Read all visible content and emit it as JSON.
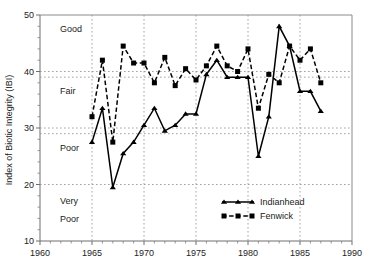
{
  "chart_data": {
    "type": "line",
    "title": "",
    "xlabel": "",
    "ylabel": "Index of Biotic Integrity (IBI)",
    "xlim": [
      1960,
      1990
    ],
    "ylim": [
      10,
      50
    ],
    "xticks": [
      1960,
      1965,
      1970,
      1975,
      1980,
      1985,
      1990
    ],
    "yticks": [
      10,
      20,
      30,
      40,
      50
    ],
    "grid": true,
    "grid_axes": "both",
    "legend_position": "inside lower right",
    "x": [
      1965,
      1966,
      1967,
      1968,
      1969,
      1970,
      1971,
      1972,
      1973,
      1974,
      1975,
      1976,
      1977,
      1978,
      1979,
      1980,
      1981,
      1982,
      1983,
      1984,
      1985,
      1986,
      1987
    ],
    "series": [
      {
        "name": "Indianhead",
        "marker": "triangle",
        "linestyle": "solid",
        "values": [
          27.5,
          33.5,
          19.5,
          25.5,
          27.5,
          30.5,
          33.5,
          29.5,
          30.5,
          32.5,
          32.5,
          39.5,
          42.0,
          39.0,
          39.0,
          39.0,
          25.0,
          32.0,
          48.0,
          44.5,
          36.5,
          36.5,
          33.0
        ]
      },
      {
        "name": "Fenwick",
        "marker": "square",
        "linestyle": "dashed",
        "values": [
          32.0,
          42.0,
          27.5,
          44.5,
          41.5,
          41.5,
          38.0,
          42.5,
          37.5,
          40.5,
          38.5,
          41.0,
          44.5,
          41.0,
          40.0,
          44.0,
          33.5,
          39.5,
          38.0,
          44.5,
          42.0,
          44.0,
          38.0
        ]
      }
    ],
    "annotations": [
      {
        "text": "Good",
        "value_range": [
          39,
          50
        ]
      },
      {
        "text": "Fair",
        "value_range": [
          29,
          39
        ]
      },
      {
        "text": "Poor",
        "value_range": [
          20,
          29
        ]
      },
      {
        "text": "Very",
        "value_range": [
          10,
          20
        ]
      },
      {
        "text": "Poor",
        "value_range": [
          10,
          20
        ]
      }
    ],
    "zone_boundaries": [
      20,
      29,
      39
    ]
  },
  "axes": {
    "y_title": "Index of Biotic Integrity (IBI)",
    "y_ticklabels": [
      "10",
      "20",
      "30",
      "40",
      "50"
    ],
    "x_ticklabels": [
      "1960",
      "1965",
      "1970",
      "1975",
      "1980",
      "1985",
      "1990"
    ]
  },
  "zones": {
    "good": "Good",
    "fair": "Fair",
    "poor": "Poor",
    "very": "Very",
    "very_poor": "Poor"
  },
  "legend": {
    "items": [
      {
        "label": "Indianhead"
      },
      {
        "label": "Fenwick"
      }
    ]
  },
  "colors": {
    "ink": "#000000",
    "axis": "#6f6f6f",
    "grid": "#8d8d8d",
    "background": "#ffffff"
  }
}
